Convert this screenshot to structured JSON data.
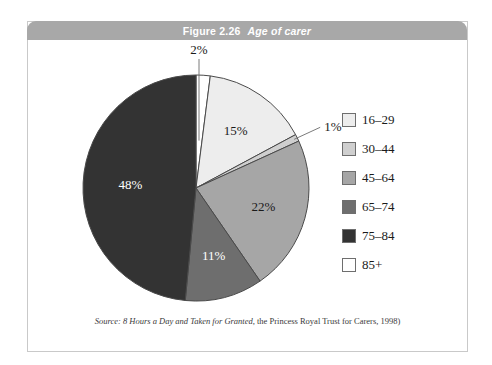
{
  "figure": {
    "number": "Figure 2.26",
    "name": "Age of carer",
    "source_lead": "Source:",
    "source_work": "8 Hours a Day and Taken for Granted",
    "source_rest": ", the Princess Royal Trust for Carers, 1998)"
  },
  "colors": {
    "title_bar": "#a8a8a8",
    "frame_border": "#c9c9c9",
    "slice_outline": "#4a4a4a",
    "label_dark": "#1a1a1a",
    "label_light": "#ffffff"
  },
  "chart_data": {
    "type": "pie",
    "title": "Age of carer",
    "categories": [
      "85+",
      "16–29",
      "30–44",
      "45–64",
      "65–74",
      "75–84"
    ],
    "values": [
      2,
      15,
      1,
      22,
      11,
      48
    ],
    "value_labels": [
      "2%",
      "15%",
      "1%",
      "22%",
      "11%",
      "48%"
    ],
    "slice_colors": [
      "#ffffff",
      "#ededed",
      "#cfcfcf",
      "#a6a6a6",
      "#6e6e6e",
      "#333333"
    ],
    "label_colors": [
      "#1a1a1a",
      "#1a1a1a",
      "#1a1a1a",
      "#1a1a1a",
      "#ffffff",
      "#ffffff"
    ],
    "start_angle_deg": 0,
    "direction": "clockwise",
    "legend": {
      "position": "right",
      "entries": [
        {
          "label": "16–29",
          "color": "#ededed"
        },
        {
          "label": "30–44",
          "color": "#cfcfcf"
        },
        {
          "label": "45–64",
          "color": "#a6a6a6"
        },
        {
          "label": "65–74",
          "color": "#6e6e6e"
        },
        {
          "label": "75–84",
          "color": "#333333"
        },
        {
          "label": "85+",
          "color": "#ffffff"
        }
      ]
    },
    "callouts": [
      {
        "label": "2%",
        "category": "85+"
      },
      {
        "label": "1%",
        "category": "30–44"
      }
    ]
  }
}
